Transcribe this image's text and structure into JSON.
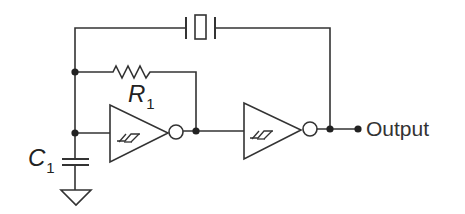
{
  "diagram": {
    "type": "circuit-schematic",
    "title": "",
    "components": [
      {
        "id": "C1",
        "kind": "capacitor",
        "label": "C",
        "subscript": "1"
      },
      {
        "id": "R1",
        "kind": "resistor",
        "label": "R",
        "subscript": "1"
      },
      {
        "id": "U1",
        "kind": "schmitt-trigger-inverter"
      },
      {
        "id": "U2",
        "kind": "schmitt-trigger-inverter"
      },
      {
        "id": "X1",
        "kind": "crystal"
      },
      {
        "id": "GND",
        "kind": "ground"
      }
    ],
    "output_label": "Output",
    "colors": {
      "line": "#333333",
      "background": "#ffffff"
    }
  },
  "labels": {
    "c1_main": "C",
    "c1_sub": "1",
    "r1_main": "R",
    "r1_sub": "1",
    "output": "Output"
  }
}
